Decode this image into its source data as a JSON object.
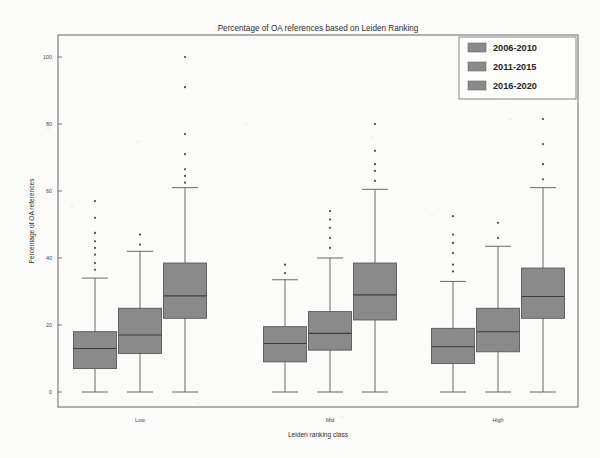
{
  "figure": {
    "title": "Percentage of OA references based on Leiden Ranking",
    "xlabel": "Leiden ranking class",
    "ylabel": "Percentage of OA references"
  },
  "legend": {
    "items": [
      {
        "label": "2006-2010",
        "color": "#8a8a8a"
      },
      {
        "label": "2011-2015",
        "color": "#8a8a8a"
      },
      {
        "label": "2016-2020",
        "color": "#8a8a8a"
      }
    ]
  },
  "axis": {
    "yticks": [
      "0",
      "20",
      "40",
      "60",
      "80",
      "100"
    ],
    "xticks": [
      "Low",
      "Mid",
      "High"
    ]
  },
  "chart_data": {
    "type": "box",
    "title": "Percentage of OA references based on Leiden Ranking",
    "xlabel": "Leiden ranking class",
    "ylabel": "Percentage of OA references",
    "categories": [
      "Low",
      "Mid",
      "High"
    ],
    "ylim": [
      0,
      105
    ],
    "yticks": [
      0,
      20,
      40,
      60,
      80,
      100
    ],
    "grid": false,
    "legend_position": "upper right",
    "box_facecolor": "#8a8a8a",
    "series": [
      {
        "name": "2006-2010",
        "boxes": [
          {
            "category": "Low",
            "whisker_low": 0,
            "q1": 7.0,
            "median": 13.0,
            "q3": 18.0,
            "whisker_high": 34.0,
            "outliers": [
              36.5,
              38.5,
              41.0,
              43.0,
              45.0,
              47.5,
              52.0,
              57.0
            ]
          },
          {
            "category": "Mid",
            "whisker_low": 0,
            "q1": 9.0,
            "median": 14.5,
            "q3": 19.5,
            "whisker_high": 33.5,
            "outliers": [
              35.5,
              38.0
            ]
          },
          {
            "category": "High",
            "whisker_low": 0,
            "q1": 8.5,
            "median": 13.5,
            "q3": 19.0,
            "whisker_high": 33.0,
            "outliers": [
              36.0,
              38.0,
              41.5,
              44.5,
              47.0,
              52.5
            ]
          }
        ]
      },
      {
        "name": "2011-2015",
        "boxes": [
          {
            "category": "Low",
            "whisker_low": 0,
            "q1": 11.5,
            "median": 17.0,
            "q3": 25.0,
            "whisker_high": 42.0,
            "outliers": [
              44.0,
              47.0
            ]
          },
          {
            "category": "Mid",
            "whisker_low": 0,
            "q1": 12.5,
            "median": 17.5,
            "q3": 24.0,
            "whisker_high": 40.0,
            "outliers": [
              43.0,
              46.0,
              49.0,
              51.5,
              54.0
            ]
          },
          {
            "category": "High",
            "whisker_low": 0,
            "q1": 12.0,
            "median": 18.0,
            "q3": 25.0,
            "whisker_high": 43.5,
            "outliers": [
              46.0,
              50.5
            ]
          }
        ]
      },
      {
        "name": "2016-2020",
        "boxes": [
          {
            "category": "Low",
            "whisker_low": 0,
            "q1": 22.0,
            "median": 28.7,
            "q3": 38.5,
            "whisker_high": 61.0,
            "outliers": [
              62.5,
              64.5,
              66.5,
              71.0,
              77.0,
              91.0,
              100.0
            ]
          },
          {
            "category": "Mid",
            "whisker_low": 0,
            "q1": 21.5,
            "median": 29.0,
            "q3": 38.5,
            "whisker_high": 60.5,
            "outliers": [
              63.0,
              66.0,
              68.0,
              72.0,
              80.0
            ]
          },
          {
            "category": "High",
            "whisker_low": 0,
            "q1": 22.0,
            "median": 28.5,
            "q3": 37.0,
            "whisker_high": 61.0,
            "outliers": [
              63.5,
              68.0,
              74.0,
              81.5
            ]
          }
        ]
      }
    ]
  }
}
